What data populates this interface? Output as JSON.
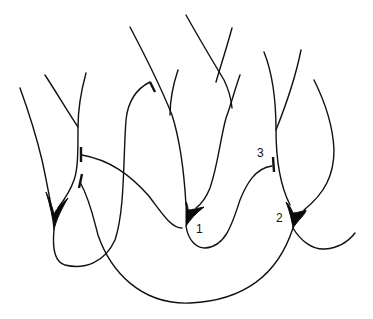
{
  "diagram": {
    "type": "neural circuit schematic",
    "colors": {
      "stroke": "#111111",
      "background": "#ffffff"
    },
    "labels": {
      "cell1": "1",
      "cell2": "2",
      "synapse3": "3"
    },
    "elements": [
      {
        "id": "left-cell",
        "kind": "pyramidal neuron (unlabeled)"
      },
      {
        "id": "cell-1",
        "kind": "pyramidal neuron",
        "label": "1"
      },
      {
        "id": "cell-2",
        "kind": "pyramidal neuron",
        "label": "2"
      },
      {
        "id": "synapse-3",
        "kind": "synaptic terminal",
        "label": "3"
      }
    ]
  }
}
